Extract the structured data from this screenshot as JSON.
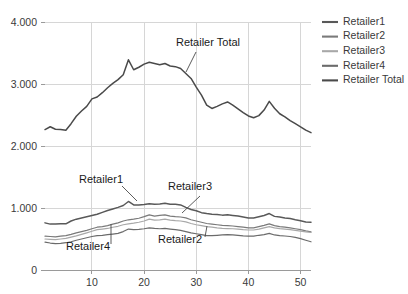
{
  "chart_data": {
    "type": "line",
    "title": "",
    "xlabel": "",
    "ylabel": "",
    "xlim": [
      1,
      52
    ],
    "ylim": [
      0,
      4000
    ],
    "grid": true,
    "y_ticks": [
      0,
      1000,
      2000,
      3000,
      4000
    ],
    "y_tick_labels": [
      "0",
      "1.000",
      "2.000",
      "3.000",
      "4.000"
    ],
    "x_ticks": [
      10,
      20,
      30,
      40,
      50
    ],
    "x_tick_labels": [
      "10",
      "20",
      "30",
      "40",
      "50"
    ],
    "legend_position": "right",
    "x": [
      1,
      2,
      3,
      4,
      5,
      6,
      7,
      8,
      9,
      10,
      11,
      12,
      13,
      14,
      15,
      16,
      17,
      18,
      19,
      20,
      21,
      22,
      23,
      24,
      25,
      26,
      27,
      28,
      29,
      30,
      31,
      32,
      33,
      34,
      35,
      36,
      37,
      38,
      39,
      40,
      41,
      42,
      43,
      44,
      45,
      46,
      47,
      48,
      49,
      50,
      51,
      52
    ],
    "series": [
      {
        "name": "Retailer1",
        "color": "#595959",
        "values": [
          760,
          740,
          740,
          745,
          745,
          790,
          820,
          840,
          860,
          880,
          900,
          930,
          960,
          985,
          1010,
          1040,
          1105,
          1050,
          1050,
          1055,
          1070,
          1060,
          1065,
          1075,
          1060,
          1060,
          1050,
          1010,
          975,
          955,
          925,
          910,
          900,
          895,
          885,
          890,
          880,
          870,
          855,
          840,
          840,
          860,
          880,
          910,
          865,
          855,
          840,
          830,
          810,
          795,
          775,
          770
        ]
      },
      {
        "name": "Retailer2",
        "color": "#7a7a7a",
        "values": [
          545,
          540,
          535,
          545,
          555,
          575,
          600,
          620,
          640,
          665,
          690,
          700,
          715,
          740,
          760,
          790,
          810,
          820,
          835,
          860,
          890,
          870,
          880,
          890,
          870,
          860,
          855,
          840,
          810,
          790,
          770,
          750,
          740,
          730,
          720,
          715,
          710,
          700,
          690,
          680,
          680,
          700,
          720,
          745,
          715,
          700,
          690,
          680,
          665,
          650,
          630,
          615
        ]
      },
      {
        "name": "Retailer3",
        "color": "#a8a8a8",
        "values": [
          500,
          495,
          490,
          500,
          510,
          530,
          550,
          575,
          600,
          625,
          650,
          660,
          670,
          690,
          705,
          730,
          745,
          755,
          770,
          790,
          820,
          805,
          810,
          820,
          805,
          795,
          790,
          775,
          750,
          730,
          715,
          700,
          690,
          680,
          672,
          668,
          665,
          658,
          650,
          645,
          645,
          660,
          680,
          700,
          680,
          668,
          660,
          650,
          640,
          628,
          615,
          605
        ]
      },
      {
        "name": "Retailer4",
        "color": "#6b6b6b",
        "values": [
          450,
          435,
          425,
          430,
          440,
          455,
          480,
          500,
          520,
          540,
          555,
          560,
          570,
          580,
          590,
          620,
          660,
          650,
          655,
          665,
          680,
          670,
          665,
          670,
          660,
          650,
          640,
          620,
          600,
          585,
          570,
          555,
          555,
          560,
          565,
          570,
          565,
          560,
          550,
          545,
          545,
          560,
          570,
          590,
          565,
          555,
          548,
          540,
          525,
          505,
          480,
          455
        ]
      },
      {
        "name": "Retailer Total",
        "color": "#4a4a4a",
        "values": [
          2265,
          2310,
          2270,
          2265,
          2255,
          2360,
          2480,
          2565,
          2640,
          2760,
          2790,
          2860,
          2940,
          3010,
          3070,
          3150,
          3390,
          3230,
          3270,
          3320,
          3350,
          3330,
          3310,
          3330,
          3290,
          3280,
          3250,
          3170,
          3090,
          2950,
          2820,
          2660,
          2605,
          2640,
          2680,
          2710,
          2660,
          2600,
          2540,
          2485,
          2455,
          2490,
          2580,
          2720,
          2610,
          2520,
          2470,
          2410,
          2360,
          2310,
          2255,
          2215
        ]
      }
    ],
    "annotations": [
      {
        "label": "Retailer Total",
        "x": 208,
        "y": 46
      },
      {
        "label": "Retailer1",
        "x": 101,
        "y": 183
      },
      {
        "label": "Retailer3",
        "x": 190,
        "y": 190
      },
      {
        "label": "Retailer2",
        "x": 180,
        "y": 243
      },
      {
        "label": "Retailer4",
        "x": 88,
        "y": 250
      }
    ]
  },
  "legend": {
    "entries": [
      {
        "label": "Retailer1",
        "color": "#595959"
      },
      {
        "label": "Retailer2",
        "color": "#7a7a7a"
      },
      {
        "label": "Retailer3",
        "color": "#a8a8a8"
      },
      {
        "label": "Retailer4",
        "color": "#6b6b6b"
      },
      {
        "label": "Retailer Total",
        "color": "#4a4a4a"
      }
    ]
  }
}
